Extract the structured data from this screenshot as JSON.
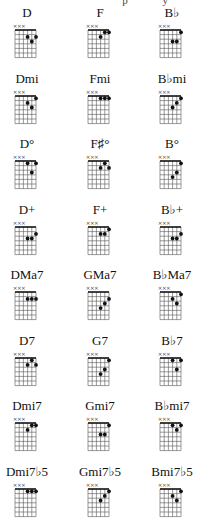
{
  "page": {
    "partial_header_text": "p y",
    "grid": {
      "strings": 6,
      "frets": 6,
      "muted_strings": [
        1,
        2,
        3
      ],
      "muted_symbol": "×"
    }
  },
  "chart_data": {
    "type": "chord-diagram-grid",
    "columns": 3,
    "chords": [
      {
        "name": "D",
        "dots": [
          [
            4,
            2
          ],
          [
            5,
            3
          ],
          [
            6,
            2
          ]
        ]
      },
      {
        "name": "F",
        "dots": [
          [
            4,
            2
          ],
          [
            5,
            1
          ],
          [
            6,
            1
          ]
        ]
      },
      {
        "name": "B♭",
        "dots": [
          [
            4,
            3
          ],
          [
            5,
            3
          ],
          [
            6,
            1
          ]
        ]
      },
      {
        "name": "Dmi",
        "dots": [
          [
            4,
            2
          ],
          [
            5,
            3
          ],
          [
            6,
            1
          ]
        ]
      },
      {
        "name": "Fmi",
        "dots": [
          [
            4,
            1
          ],
          [
            5,
            1
          ],
          [
            6,
            1
          ]
        ]
      },
      {
        "name": "B♭mi",
        "dots": [
          [
            4,
            3
          ],
          [
            5,
            2
          ],
          [
            6,
            1
          ]
        ]
      },
      {
        "name": "D°",
        "dots": [
          [
            4,
            1
          ],
          [
            5,
            3
          ],
          [
            6,
            1
          ]
        ]
      },
      {
        "name": "F♯°",
        "dots": [
          [
            4,
            2
          ],
          [
            5,
            1
          ],
          [
            6,
            2
          ]
        ]
      },
      {
        "name": "B°",
        "dots": [
          [
            4,
            4
          ],
          [
            5,
            3
          ],
          [
            6,
            1
          ]
        ]
      },
      {
        "name": "D+",
        "dots": [
          [
            4,
            3
          ],
          [
            5,
            3
          ],
          [
            6,
            2
          ]
        ]
      },
      {
        "name": "F+",
        "dots": [
          [
            4,
            2
          ],
          [
            5,
            2
          ],
          [
            6,
            1
          ]
        ]
      },
      {
        "name": "B♭+",
        "dots": [
          [
            4,
            3
          ],
          [
            5,
            3
          ],
          [
            6,
            2
          ]
        ]
      },
      {
        "name": "DMa7",
        "dots": [
          [
            4,
            2
          ],
          [
            5,
            2
          ],
          [
            6,
            2
          ]
        ]
      },
      {
        "name": "GMa7",
        "dots": [
          [
            4,
            4
          ],
          [
            5,
            3
          ],
          [
            6,
            2
          ]
        ]
      },
      {
        "name": "B♭Ma7",
        "dots": [
          [
            4,
            2
          ],
          [
            5,
            3
          ],
          [
            6,
            1
          ]
        ]
      },
      {
        "name": "D7",
        "dots": [
          [
            4,
            2
          ],
          [
            5,
            1
          ],
          [
            6,
            2
          ]
        ]
      },
      {
        "name": "G7",
        "dots": [
          [
            4,
            4
          ],
          [
            5,
            3
          ],
          [
            6,
            1
          ]
        ]
      },
      {
        "name": "B♭7",
        "dots": [
          [
            4,
            1
          ],
          [
            5,
            3
          ],
          [
            6,
            1
          ]
        ]
      },
      {
        "name": "Dmi7",
        "dots": [
          [
            4,
            2
          ],
          [
            5,
            1
          ],
          [
            6,
            1
          ]
        ]
      },
      {
        "name": "Gmi7",
        "dots": [
          [
            4,
            3
          ],
          [
            5,
            3
          ],
          [
            6,
            1
          ]
        ]
      },
      {
        "name": "B♭mi7",
        "dots": [
          [
            4,
            1
          ],
          [
            5,
            2
          ],
          [
            6,
            1
          ]
        ]
      },
      {
        "name": "Dmi7♭5",
        "dots": [
          [
            4,
            1
          ],
          [
            5,
            1
          ],
          [
            6,
            1
          ]
        ]
      },
      {
        "name": "Gmi7♭5",
        "dots": [
          [
            4,
            3
          ],
          [
            5,
            2
          ],
          [
            6,
            1
          ]
        ]
      },
      {
        "name": "Bmi7♭5",
        "dots": [
          [
            4,
            2
          ],
          [
            5,
            3
          ],
          [
            6,
            1
          ]
        ]
      }
    ]
  }
}
